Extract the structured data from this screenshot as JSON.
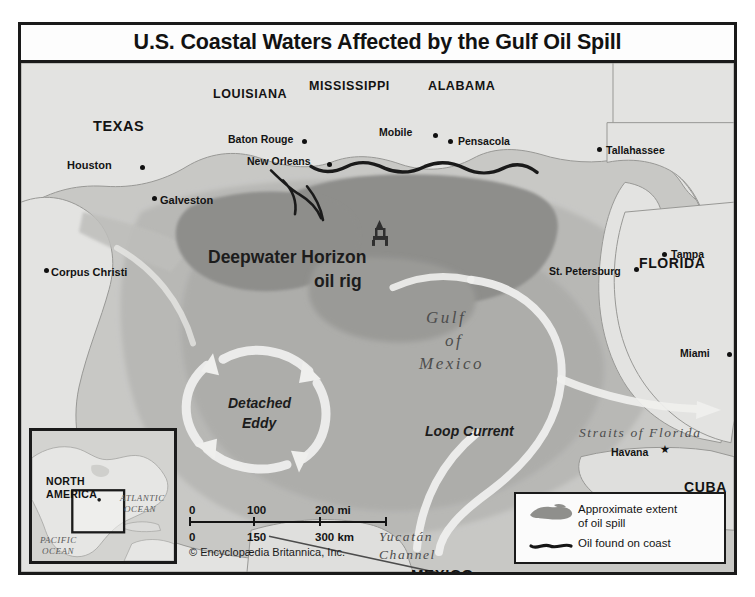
{
  "title": "U.S. Coastal Waters Affected by the Gulf Oil Spill",
  "credit": "© Encyclopædia Britannica, Inc.",
  "states": [
    {
      "name": "TEXAS",
      "x": 72,
      "y": 55,
      "size": 14.5
    },
    {
      "name": "LOUISIANA",
      "x": 192,
      "y": 24,
      "size": 12.5
    },
    {
      "name": "MISSISSIPPI",
      "x": 288,
      "y": 16,
      "size": 12.5
    },
    {
      "name": "ALABAMA",
      "x": 407,
      "y": 16,
      "size": 12.5
    },
    {
      "name": "FLORIDA",
      "x": 618,
      "y": 192,
      "size": 14
    },
    {
      "name": "MEXICO",
      "x": 390,
      "y": 503,
      "size": 15
    },
    {
      "name": "CUBA",
      "x": 663,
      "y": 416,
      "size": 14
    }
  ],
  "cities": [
    {
      "name": "Houston",
      "lx": 46,
      "ly": 96,
      "dx": 119,
      "dy": 102,
      "size": 11,
      "anchor": "left"
    },
    {
      "name": "Galveston",
      "lx": 139,
      "ly": 131,
      "dx": 131,
      "dy": 133,
      "size": 11,
      "anchor": "left"
    },
    {
      "name": "Corpus Christi",
      "lx": 30,
      "ly": 203,
      "dx": 23,
      "dy": 205,
      "size": 11,
      "anchor": "left"
    },
    {
      "name": "Baton Rouge",
      "lx": 207,
      "ly": 70,
      "dx": 281,
      "dy": 76,
      "size": 10.5,
      "anchor": "left"
    },
    {
      "name": "New Orleans",
      "lx": 226,
      "ly": 92,
      "dx": 306,
      "dy": 99,
      "size": 10.5,
      "anchor": "left"
    },
    {
      "name": "Mobile",
      "lx": 358,
      "ly": 63,
      "dx": 412,
      "dy": 70,
      "size": 10.5,
      "anchor": "left"
    },
    {
      "name": "Pensacola",
      "lx": 437,
      "ly": 72,
      "dx": 427,
      "dy": 76,
      "size": 10.5,
      "anchor": "left"
    },
    {
      "name": "Tallahassee",
      "lx": 585,
      "ly": 81,
      "dx": 576,
      "dy": 84,
      "size": 10.5,
      "anchor": "left"
    },
    {
      "name": "Tampa",
      "lx": 650,
      "ly": 185,
      "dx": 641,
      "dy": 189,
      "size": 10.5,
      "anchor": "left"
    },
    {
      "name": "St. Petersburg",
      "lx": 528,
      "ly": 202,
      "dx": 613,
      "dy": 204,
      "size": 10.5,
      "anchor": "left"
    },
    {
      "name": "Miami",
      "lx": 659,
      "ly": 284,
      "dx": 706,
      "dy": 289,
      "size": 10.5,
      "anchor": "left"
    },
    {
      "name": "Havana",
      "lx": 590,
      "ly": 383,
      "dx": 0,
      "dy": 0,
      "size": 10.5,
      "anchor": "left",
      "capital": true,
      "sx": 639,
      "sy": 382
    }
  ],
  "water_labels": [
    {
      "name": "Gulf",
      "x": 405,
      "y": 245,
      "size": 17,
      "spacing": 2.5
    },
    {
      "name": "of",
      "x": 424,
      "y": 268,
      "size": 17,
      "spacing": 2.5
    },
    {
      "name": "Mexico",
      "x": 398,
      "y": 291,
      "size": 17,
      "spacing": 2.5
    },
    {
      "name": "Straits of Florida",
      "x": 558,
      "y": 362,
      "size": 13.5,
      "spacing": 1.6
    },
    {
      "name": "Yucatán",
      "x": 358,
      "y": 466,
      "size": 13.5,
      "spacing": 1.6
    },
    {
      "name": "Channel",
      "x": 358,
      "y": 484,
      "size": 13.5,
      "spacing": 1.6
    }
  ],
  "feature_labels": [
    {
      "name": "Deepwater Horizon",
      "x": 187,
      "y": 184,
      "size": 17.5
    },
    {
      "name": "oil rig",
      "x": 293,
      "y": 208,
      "size": 17.5
    },
    {
      "name": "Detached",
      "x": 207,
      "y": 332,
      "size": 14
    },
    {
      "name": "Eddy",
      "x": 221,
      "y": 352,
      "size": 14
    },
    {
      "name": "Loop Current",
      "x": 404,
      "y": 360,
      "size": 14
    }
  ],
  "inset": {
    "region": "NORTH\nAMERICA",
    "region_line1": "NORTH",
    "region_line2": "AMERICA",
    "ocean_atlantic_line1": "ATLANTIC",
    "ocean_atlantic_line2": "OCEAN",
    "ocean_pacific_line1": "PACIFIC",
    "ocean_pacific_line2": "OCEAN"
  },
  "scale": {
    "miles": {
      "ticks": [
        "0",
        "100",
        "200 mi"
      ],
      "unit": "mi"
    },
    "km": {
      "ticks": [
        "0",
        "150",
        "300 km"
      ],
      "unit": "km"
    }
  },
  "legend": {
    "items": [
      {
        "symbol": "oil-spill-extent-swatch",
        "line1": "Approximate extent",
        "line2": "of oil spill"
      },
      {
        "symbol": "oil-on-coast-swatch",
        "line1": "Oil found on coast",
        "line2": ""
      }
    ]
  },
  "colors": {
    "land": "#e8e8e6",
    "shallow_water": "#c9c9c6",
    "deep_water": "#b4b4b1",
    "oil_extent": "#8e8e8b",
    "oil_coast": "#141414",
    "current": "#f4f4f2",
    "frame": "#1a1a1a"
  }
}
